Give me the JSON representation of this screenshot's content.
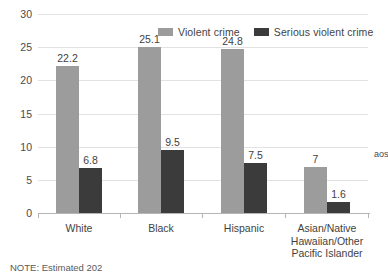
{
  "chart_data": {
    "type": "bar",
    "title": "",
    "xlabel": "",
    "ylabel": "",
    "ylim": [
      0,
      30
    ],
    "grid": true,
    "legend_position": "top-center",
    "categories": [
      "White",
      "Black",
      "Hispanic",
      "Asian/Native Hawaiian/Other Pacific Islander"
    ],
    "ytick_labels": [
      "0",
      "5",
      "10",
      "15",
      "20",
      "25",
      "30"
    ],
    "ytick_values": [
      0,
      5,
      10,
      15,
      20,
      25,
      30
    ],
    "series": [
      {
        "name": "Violent crime",
        "color": "#9c9c9c",
        "values": [
          22.2,
          25.1,
          24.8,
          7
        ],
        "labels": [
          "22.2",
          "25.1",
          "24.8",
          "7"
        ]
      },
      {
        "name": "Serious violent crime",
        "color": "#3b3b3b",
        "values": [
          6.8,
          9.5,
          7.5,
          1.6
        ],
        "labels": [
          "6.8",
          "9.5",
          "7.5",
          "1.6"
        ]
      }
    ]
  },
  "legend": {
    "entries": [
      {
        "label": "Violent crime",
        "color": "#9c9c9c"
      },
      {
        "label": "Serious violent crime",
        "color": "#3b3b3b"
      }
    ]
  },
  "category_lines": [
    [
      "White"
    ],
    [
      "Black"
    ],
    [
      "Hispanic"
    ],
    [
      "Asian/Native",
      "Hawaiian/Other",
      "Pacific Islander"
    ]
  ],
  "footnote": "NOTE: Estimated 202",
  "side_text": "aosvbD"
}
